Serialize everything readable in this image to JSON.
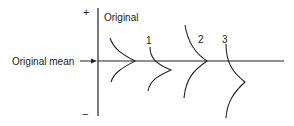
{
  "diagram": {
    "axis": {
      "plus_label": "+",
      "minus_label": "−"
    },
    "reference_line_label": "Original mean",
    "curves": [
      {
        "id": "original",
        "label": "Original",
        "description": "distribution centered on original mean"
      },
      {
        "id": "1",
        "label": "1",
        "description": "distribution shifted below mean, same spread"
      },
      {
        "id": "2",
        "label": "2",
        "description": "distribution with greater spread, centered on mean"
      },
      {
        "id": "3",
        "label": "3",
        "description": "distribution shifted below mean with greater spread"
      }
    ],
    "colors": {
      "line": "#222222",
      "background": "#ffffff"
    }
  }
}
